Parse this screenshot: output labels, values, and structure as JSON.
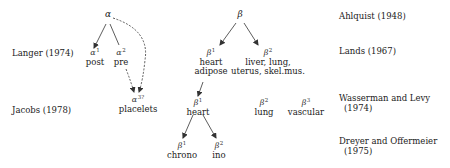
{
  "diagram": {
    "roots": [
      {
        "id": "alpha",
        "symbol": "α"
      },
      {
        "id": "beta",
        "symbol": "β"
      }
    ],
    "nodes": [
      {
        "id": "alpha1",
        "symbol": "α",
        "sup": "1",
        "text": "post",
        "parent": "alpha"
      },
      {
        "id": "alpha2",
        "symbol": "α",
        "sup": "2",
        "text": "pre",
        "parent": "alpha"
      },
      {
        "id": "alpha3",
        "symbol": "α",
        "sup": "3?",
        "text": "placelets",
        "parent": "alpha",
        "dashed": true
      },
      {
        "id": "beta1",
        "symbol": "β",
        "sup": "1",
        "text": "heart",
        "text2": "adipose",
        "parent": "beta"
      },
      {
        "id": "beta2",
        "symbol": "β",
        "sup": "2",
        "text": "liver, lung,",
        "text2": "uterus, skel.mus.",
        "parent": "beta"
      },
      {
        "id": "beta1b",
        "symbol": "β",
        "sup": "1",
        "text": "heart",
        "parent": "beta1"
      },
      {
        "id": "beta2b",
        "symbol": "β",
        "sup": "2",
        "text": "lung"
      },
      {
        "id": "beta3",
        "symbol": "β",
        "sup": "3",
        "text": "vascular"
      },
      {
        "id": "beta1c",
        "symbol": "β",
        "sup": "1",
        "text": "chrono",
        "parent": "beta1b"
      },
      {
        "id": "beta2c",
        "symbol": "β",
        "sup": "2",
        "text": "ino",
        "parent": "beta1b"
      }
    ],
    "left_labels": [
      {
        "text": "Langer (1974)"
      },
      {
        "text": "Jacobs (1978)"
      }
    ],
    "right_labels": [
      {
        "text": "Ahlquist (1948)"
      },
      {
        "text": "Lands (1967)"
      },
      {
        "text": "Wasserman and Levy",
        "text2": "(1974)"
      },
      {
        "text": "Dreyer and Offermeier",
        "text2": "(1975)"
      }
    ]
  }
}
